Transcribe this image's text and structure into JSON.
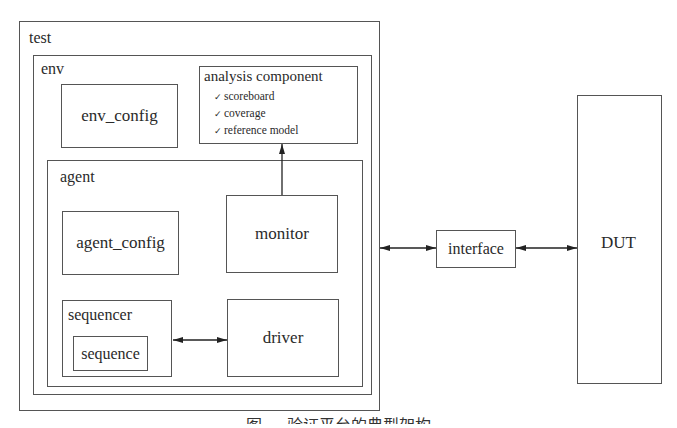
{
  "diagram": {
    "test": {
      "label": "test"
    },
    "env": {
      "label": "env"
    },
    "env_config": {
      "label": "env_config"
    },
    "analysis_component": {
      "title": "analysis component",
      "items": [
        "scoreboard",
        "coverage",
        "reference model"
      ],
      "check_glyph": "✓"
    },
    "agent": {
      "label": "agent"
    },
    "agent_config": {
      "label": "agent_config"
    },
    "monitor": {
      "label": "monitor"
    },
    "sequencer": {
      "label": "sequencer"
    },
    "sequence": {
      "label": "sequence"
    },
    "driver": {
      "label": "driver"
    },
    "interface": {
      "label": "interface"
    },
    "dut": {
      "label": "DUT"
    },
    "connections": [
      {
        "from": "monitor",
        "to": "analysis component",
        "type": "uni"
      },
      {
        "from": "sequencer",
        "to": "driver",
        "type": "bi"
      },
      {
        "from": "test",
        "to": "interface",
        "type": "bi"
      },
      {
        "from": "interface",
        "to": "DUT",
        "type": "bi"
      }
    ],
    "caption": "图 ... 验证平台的典型架构"
  }
}
